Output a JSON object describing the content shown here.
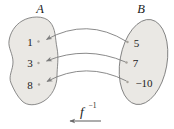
{
  "diagram": {
    "type": "inverse-function-mapping",
    "set_a": {
      "label": "A",
      "elements": [
        "1",
        "3",
        "8"
      ]
    },
    "set_b": {
      "label": "B",
      "elements": [
        "5",
        "7",
        "−10"
      ]
    },
    "mappings": [
      {
        "from": "5",
        "to": "1"
      },
      {
        "from": "7",
        "to": "3"
      },
      {
        "from": "−10",
        "to": "8"
      }
    ],
    "function_label": "f",
    "function_superscript": "−1",
    "arrow_direction": "left"
  },
  "colors": {
    "set_fill": "#eae8e4",
    "set_stroke": "#6f6f6f",
    "arrow": "#7d7d7d",
    "fn_arrow": "#6a6a6a",
    "dot": "#a8a39c",
    "text": "#1a1a1a"
  }
}
